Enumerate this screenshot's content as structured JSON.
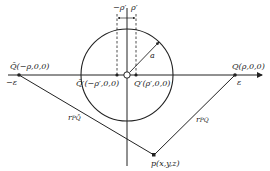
{
  "figure": {
    "colors": {
      "ink": "#222222",
      "background": "#ffffff"
    },
    "points": {
      "Q_bar": {
        "label": "Q̄(−ρ,0,0)",
        "epsilon": "−ε"
      },
      "Q_bar_prime": {
        "label": "Q̄′(−ρ′,0,0)"
      },
      "Q_prime": {
        "label": "Q′(ρ′,0,0)"
      },
      "Q": {
        "label": "Q(ρ,0,0)",
        "epsilon": "ε"
      },
      "P": {
        "label": "p(x,y,z)"
      }
    },
    "dimensions": {
      "minus_rho_prime": "−ρ′",
      "rho_prime": "ρ′",
      "radius": "a"
    },
    "distances": {
      "r_PQbar": "r",
      "r_PQbar_sub": "PQ̄",
      "r_PQ": "r",
      "r_PQ_sub": "PQ"
    }
  }
}
